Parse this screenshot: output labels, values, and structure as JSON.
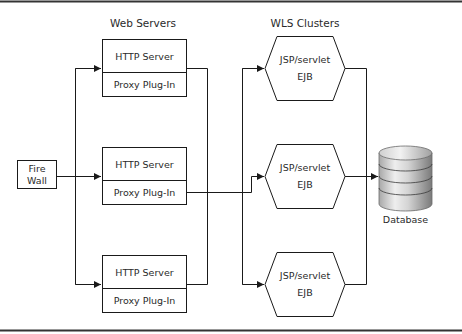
{
  "diagram": {
    "column_titles": {
      "web_servers": "Web Servers",
      "wls_clusters": "WLS Clusters"
    },
    "firewall": {
      "line1": "Fire",
      "line2": "Wall"
    },
    "web_servers": [
      {
        "top_label": "HTTP Server",
        "bottom_label": "Proxy Plug-In"
      },
      {
        "top_label": "HTTP Server",
        "bottom_label": "Proxy Plug-In"
      },
      {
        "top_label": "HTTP Server",
        "bottom_label": "Proxy Plug-In"
      }
    ],
    "clusters": [
      {
        "line1": "JSP/servlet",
        "line2": "EJB"
      },
      {
        "line1": "JSP/servlet",
        "line2": "EJB"
      },
      {
        "line1": "JSP/servlet",
        "line2": "EJB"
      }
    ],
    "database": {
      "label": "Database"
    },
    "colors": {
      "line": "#1a1a1a",
      "frame": "#333333",
      "db_light": "#e6e6e6",
      "db_dark": "#8a8a8a"
    }
  }
}
